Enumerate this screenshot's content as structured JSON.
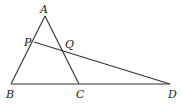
{
  "diagram": {
    "type": "geometry",
    "points": {
      "A": {
        "label": "A",
        "x": 45,
        "y": 16
      },
      "B": {
        "label": "B",
        "x": 11,
        "y": 84
      },
      "C": {
        "label": "C",
        "x": 79,
        "y": 84
      },
      "D": {
        "label": "D",
        "x": 170,
        "y": 84
      },
      "P": {
        "label": "P",
        "x": 34,
        "y": 42
      },
      "Q": {
        "label": "Q",
        "x": 62,
        "y": 51
      }
    },
    "segments": [
      "AB",
      "AC",
      "BD",
      "PD"
    ]
  }
}
